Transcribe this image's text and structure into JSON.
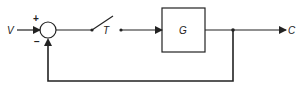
{
  "diagram": {
    "type": "feedback-control-block-diagram",
    "input_label": "V",
    "output_label": "C",
    "switch_label": "T",
    "block_label": "G",
    "summing_junction": {
      "plus_sign": "+",
      "minus_sign": "−"
    },
    "colors": {
      "line": "#222222",
      "background": "#ffffff"
    }
  }
}
